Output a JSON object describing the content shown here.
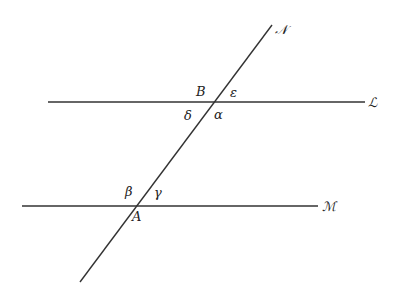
{
  "diagram": {
    "lines": {
      "L": {
        "label": "ℒ",
        "x1": 48,
        "y1": 102,
        "x2": 365,
        "y2": 102,
        "label_x": 368,
        "label_y": 107
      },
      "M": {
        "label": "ℳ",
        "x1": 22,
        "y1": 206,
        "x2": 318,
        "y2": 206,
        "label_x": 322,
        "label_y": 211
      },
      "N": {
        "label": "𝒩",
        "x1": 80,
        "y1": 282,
        "x2": 272,
        "y2": 25,
        "label_x": 275,
        "label_y": 34
      }
    },
    "points": {
      "B": {
        "label": "B",
        "x": 196,
        "y": 96
      },
      "A": {
        "label": "A",
        "x": 132,
        "y": 221
      }
    },
    "angles": {
      "epsilon": {
        "label": "ε",
        "x": 230,
        "y": 97
      },
      "delta": {
        "label": "δ",
        "x": 184,
        "y": 120
      },
      "alpha": {
        "label": "α",
        "x": 214,
        "y": 119
      },
      "beta": {
        "label": "β",
        "x": 125,
        "y": 196
      },
      "gamma": {
        "label": "γ",
        "x": 154,
        "y": 197
      }
    }
  }
}
